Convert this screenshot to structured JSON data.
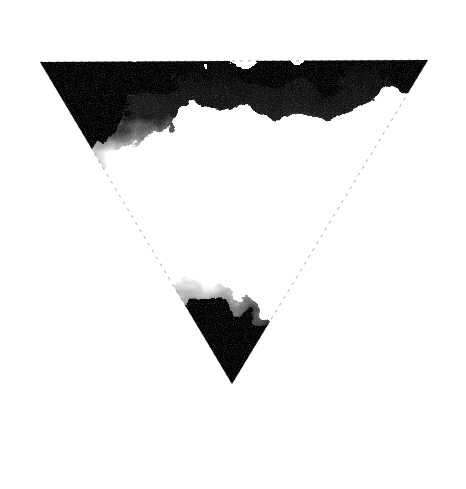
{
  "image": {
    "subject": "grainy inverted triangle",
    "background_color": "#ffffff",
    "ink_color": "#0a0a0a",
    "vertices": {
      "top_left": [
        40,
        62
      ],
      "top_right": [
        428,
        60
      ],
      "bottom": [
        232,
        384
      ]
    }
  }
}
